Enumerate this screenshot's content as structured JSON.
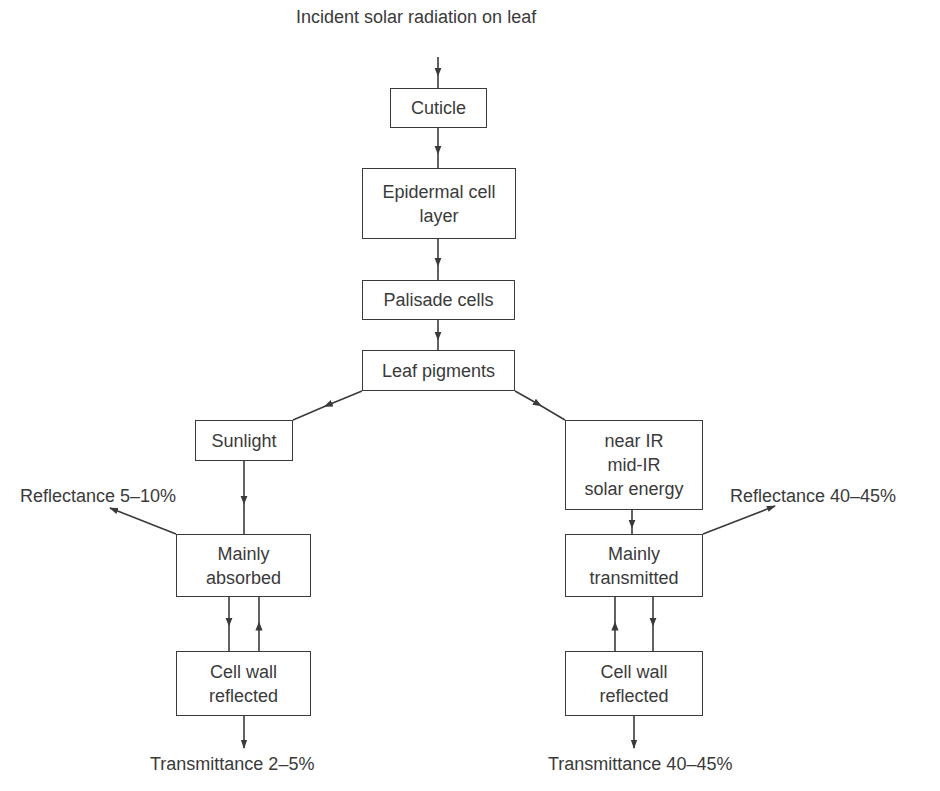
{
  "diagram": {
    "title": "Incident solar radiation on leaf",
    "nodes": {
      "cuticle": [
        "Cuticle"
      ],
      "epidermal": [
        "Epidermal cell",
        "layer"
      ],
      "palisade": [
        "Palisade cells"
      ],
      "pigments": [
        "Leaf pigments"
      ],
      "sunlight": [
        "Sunlight"
      ],
      "infrared": [
        "near IR",
        "mid-IR",
        "solar energy"
      ],
      "absorbed": [
        "Mainly",
        "absorbed"
      ],
      "transmitted": [
        "Mainly",
        "transmitted"
      ],
      "cellwall_left": [
        "Cell wall",
        "reflected"
      ],
      "cellwall_right": [
        "Cell wall",
        "reflected"
      ]
    },
    "outputs": {
      "reflectance_left": "Reflectance 5–10%",
      "reflectance_right": "Reflectance 40–45%",
      "transmittance_left": "Transmittance 2–5%",
      "transmittance_right": "Transmittance 40–45%"
    },
    "colors": {
      "line": "#3a3a3a",
      "background": "#ffffff"
    }
  }
}
